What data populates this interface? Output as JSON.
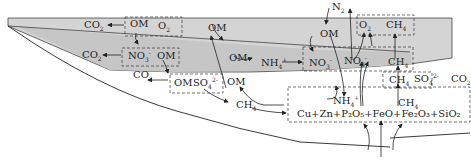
{
  "diagram": {
    "colors": {
      "layer_fill": "#d4d4d4",
      "line": "#222222",
      "background": "#ffffff"
    },
    "labels": {
      "n2": {
        "main": "N",
        "sub": "2"
      },
      "co2_a": {
        "main": "CO",
        "sub": "2"
      },
      "om_a": "OM",
      "o2_a": {
        "main": "O",
        "sub": "2"
      },
      "om_b": "OM",
      "om_c": "OM",
      "o2_b": {
        "main": "O",
        "sub": "2"
      },
      "ch4_a": {
        "main": "CH",
        "sub": "4"
      },
      "co2_b": {
        "main": "CO",
        "sub": "2"
      },
      "no3_a": {
        "main": "NO",
        "sub": "3",
        "sup": "-"
      },
      "om_d": "OM",
      "om_e": "OM",
      "nh4_a": {
        "main": "NH",
        "sub": "4",
        "sup": "+"
      },
      "no3_b": {
        "main": "NO",
        "sub": "3",
        "sup": "-"
      },
      "no3_c": {
        "main": "NO",
        "sub": "3",
        "sup": "-"
      },
      "ch4_b": {
        "main": "CH",
        "sub": "4"
      },
      "co2_c": {
        "main": "CO",
        "sub": "2"
      },
      "om_f": "OM",
      "so4_a": {
        "main": "SO",
        "sub": "4",
        "sup": "2-"
      },
      "om_g": "OM",
      "ch4_c": {
        "main": "CH",
        "sub": "4"
      },
      "so4_b": {
        "main": "SO",
        "sub": "4",
        "sup": "2-"
      },
      "co2_d": {
        "main": "CO",
        "sub": "2"
      },
      "ch4_d": {
        "main": "CH",
        "sub": "4"
      },
      "nh4_b": {
        "main": "NH",
        "sub": "4",
        "sup": "+"
      },
      "ch4_e": {
        "main": "CH",
        "sub": "4"
      },
      "minerals": "Cu+Zn+P₂O₅+FeO+Fe₂O₃+SiO₂"
    }
  }
}
